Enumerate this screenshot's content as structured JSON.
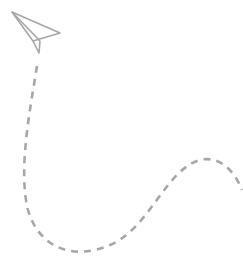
{
  "illustration": {
    "subject": "paper-plane-with-dashed-trail",
    "stroke_color": "#a6a6a6",
    "background": "#ffffff"
  }
}
